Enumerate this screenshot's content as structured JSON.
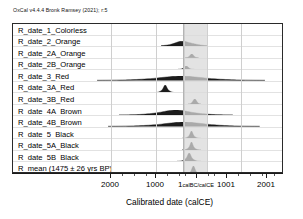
{
  "credit": "OxCal v4.4.4 Bronk Ramsey (2021); r:5",
  "axis": {
    "title": "Calibrated date (calCE)",
    "ticks": [
      {
        "label": "2000",
        "sub": "",
        "x": 110
      },
      {
        "label": "1000",
        "sub": "",
        "x": 155
      },
      {
        "label": "1",
        "sub": "calBC/calCE",
        "x": 196
      },
      {
        "label": "1001",
        "sub": "",
        "x": 226
      },
      {
        "label": "2001",
        "sub": "",
        "x": 266
      }
    ],
    "minor_ticks": [
      122,
      134,
      146,
      167,
      179,
      185,
      208,
      214,
      238,
      250,
      262,
      274
    ],
    "gridlines": [
      110,
      155,
      183,
      206,
      240
    ],
    "highlight_band": {
      "start": 182,
      "end": 206,
      "color": "#d9d9d9"
    }
  },
  "chart_data": {
    "type": "area",
    "title": "OxCal v4.4.4 Bronk Ramsey (2021); r:5",
    "xlabel": "Calibrated date (calCE)",
    "ylabel": "",
    "xlim": [
      -2100,
      2100
    ],
    "rows": [
      {
        "label": "R_date_1_Colorless",
        "center": 0.52,
        "width": 0.06,
        "height": 0.0,
        "shape": "none"
      },
      {
        "label": "R_date_2_Orange",
        "center": 0.63,
        "width": 0.17,
        "height": 0.3,
        "shape": "broad"
      },
      {
        "label": "R_date_2A_Orange",
        "center": 0.66,
        "width": 0.05,
        "height": 0.22,
        "shape": "narrow"
      },
      {
        "label": "R_date_2B_Orange",
        "center": 0.64,
        "width": 0.06,
        "height": 0.2,
        "shape": "narrow"
      },
      {
        "label": "R_date_3_Red",
        "center": 0.62,
        "width": 0.62,
        "height": 0.26,
        "shape": "wide-flat"
      },
      {
        "label": "R_date_3A_Red",
        "center": 0.56,
        "width": 0.09,
        "height": 0.46,
        "shape": "peak"
      },
      {
        "label": "R_date_3B_Red",
        "center": 0.67,
        "width": 0.05,
        "height": 0.3,
        "shape": "narrow"
      },
      {
        "label": "R_date_4A_Brown",
        "center": 0.6,
        "width": 0.42,
        "height": 0.3,
        "shape": "wide-flat"
      },
      {
        "label": "R_date_4B_Brown",
        "center": 0.63,
        "width": 0.56,
        "height": 0.26,
        "shape": "wide-flat"
      },
      {
        "label": "R_date_5_Black",
        "center": 0.66,
        "width": 0.07,
        "height": 0.44,
        "shape": "peak"
      },
      {
        "label": "R_date_5A_Black",
        "center": 0.66,
        "width": 0.07,
        "height": 0.48,
        "shape": "peak"
      },
      {
        "label": "R_date_5B_Black",
        "center": 0.65,
        "width": 0.09,
        "height": 0.5,
        "shape": "peak"
      },
      {
        "label": "R_mean (1475 ± 26 yrs BP)",
        "center": 0.665,
        "width": 0.04,
        "height": 0.4,
        "shape": "narrow"
      }
    ]
  }
}
